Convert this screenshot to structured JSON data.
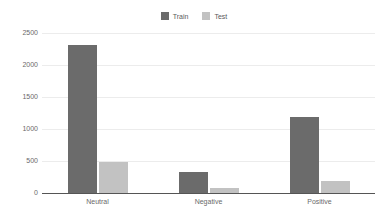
{
  "chart_data": {
    "type": "bar",
    "title": "",
    "subtitle": "",
    "xlabel": "",
    "ylabel": "",
    "categories": [
      "Neutral",
      "Negative",
      "Positive"
    ],
    "series": [
      {
        "name": "Train",
        "color": "#6b6b6b",
        "values": [
          2310,
          330,
          1190
        ]
      },
      {
        "name": "Test",
        "color": "#c2c2c2",
        "values": [
          490,
          80,
          190
        ]
      }
    ],
    "ylim": [
      0,
      2500
    ],
    "ytick_labels": [
      "0",
      "500",
      "1000",
      "1500",
      "2000",
      "2500"
    ],
    "ytick_values": [
      0,
      500,
      1000,
      1500,
      2000,
      2500
    ],
    "grid": true,
    "grid_axis": "y",
    "grid_color": "#ececec",
    "axis_color": "#555555",
    "legend_position": "top-center",
    "background_color": "#ffffff",
    "tick_label_color": "#6a6a6a"
  },
  "legend": {
    "entries": [
      {
        "label": "Train",
        "swatch_name": "legend-swatch-train"
      },
      {
        "label": "Test",
        "swatch_name": "legend-swatch-test"
      }
    ]
  }
}
